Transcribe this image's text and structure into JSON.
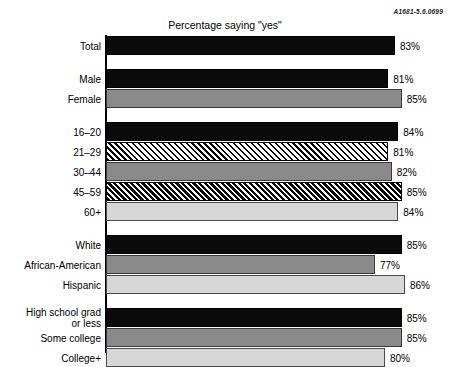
{
  "code_stamp": "A1681-5.6.0699",
  "chart_data": {
    "type": "bar",
    "orientation": "horizontal",
    "title": "Percentage saying \"yes\"",
    "xlabel": "",
    "ylabel": "",
    "xlim": [
      0,
      100
    ],
    "grid": false,
    "legend": "none",
    "value_suffix": "%",
    "groups": [
      {
        "name": "total",
        "bars": [
          {
            "category": "Total",
            "value": 83,
            "value_label": "83%",
            "fill": "solid-black"
          }
        ]
      },
      {
        "name": "gender",
        "bars": [
          {
            "category": "Male",
            "value": 81,
            "value_label": "81%",
            "fill": "solid-black"
          },
          {
            "category": "Female",
            "value": 85,
            "value_label": "85%",
            "fill": "mid-gray"
          }
        ]
      },
      {
        "name": "age",
        "bars": [
          {
            "category": "16–20",
            "value": 84,
            "value_label": "84%",
            "fill": "solid-black"
          },
          {
            "category": "21–29",
            "value": 81,
            "value_label": "81%",
            "fill": "hatch-light"
          },
          {
            "category": "30–44",
            "value": 82,
            "value_label": "82%",
            "fill": "mid-gray"
          },
          {
            "category": "45–59",
            "value": 85,
            "value_label": "85%",
            "fill": "hatch-dark"
          },
          {
            "category": "60+",
            "value": 84,
            "value_label": "84%",
            "fill": "light-gray"
          }
        ]
      },
      {
        "name": "race-ethnicity",
        "bars": [
          {
            "category": "White",
            "value": 85,
            "value_label": "85%",
            "fill": "solid-black"
          },
          {
            "category": "African-American",
            "value": 77,
            "value_label": "77%",
            "fill": "mid-gray"
          },
          {
            "category": "Hispanic",
            "value": 86,
            "value_label": "86%",
            "fill": "light-gray"
          }
        ]
      },
      {
        "name": "education",
        "bars": [
          {
            "category": "High school grad\nor less",
            "value": 85,
            "value_label": "85%",
            "fill": "solid-black"
          },
          {
            "category": "Some college",
            "value": 85,
            "value_label": "85%",
            "fill": "mid-gray"
          },
          {
            "category": "College+",
            "value": 80,
            "value_label": "80%",
            "fill": "light-gray"
          }
        ]
      }
    ]
  }
}
